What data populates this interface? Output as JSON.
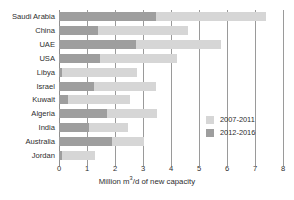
{
  "chart_data": {
    "type": "bar",
    "orientation": "horizontal",
    "stacked": true,
    "title": "",
    "subtitle": "",
    "xlabel": "Million m3/d of new capacity",
    "xlabel_parts": {
      "pre": "Million m",
      "sup": "3",
      "post": "/d of new capacity"
    },
    "ylabel": "",
    "xlim": [
      0,
      8
    ],
    "xticks": [
      0,
      1,
      2,
      3,
      4,
      5,
      6,
      7,
      8
    ],
    "xtick_labels": [
      "0",
      "1",
      "2",
      "3",
      "4",
      "5",
      "6",
      "7",
      "8"
    ],
    "grid": "vertical",
    "legend_position": "inside-right",
    "categories": [
      "Saudi Arabia",
      "China",
      "UAE",
      "USA",
      "Libya",
      "Israel",
      "Kuwait",
      "Algeria",
      "India",
      "Australia",
      "Jordan"
    ],
    "series": [
      {
        "name": "2012-2016",
        "color": "#9e9e9e",
        "values": [
          3.45,
          1.38,
          2.75,
          1.48,
          0.12,
          1.25,
          0.32,
          1.72,
          1.08,
          1.9,
          0.1
        ]
      },
      {
        "name": "2007-2011",
        "color": "#d6d6d6",
        "values": [
          3.95,
          3.22,
          3.05,
          2.72,
          2.68,
          2.2,
          2.23,
          1.78,
          1.37,
          1.15,
          1.2
        ]
      }
    ],
    "totals": [
      7.4,
      4.6,
      5.8,
      4.2,
      2.8,
      3.45,
      2.55,
      3.5,
      2.45,
      3.05,
      1.3
    ],
    "stack_order": [
      "2012-2016",
      "2007-2011"
    ]
  },
  "legend": {
    "items": [
      {
        "label": "2007-2011",
        "color": "#d6d6d6"
      },
      {
        "label": "2012-2016",
        "color": "#9e9e9e"
      }
    ]
  },
  "colors": {
    "early_period": "#d6d6d6",
    "late_period": "#9e9e9e",
    "gridline": "#9a9a9a",
    "text": "#2e2e2e",
    "background": "#ffffff"
  }
}
